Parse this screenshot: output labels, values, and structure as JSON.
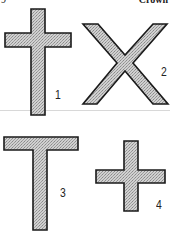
{
  "header": {
    "page_fragment": "9",
    "section_fragment": "Crown"
  },
  "figures": [
    {
      "id": 1,
      "shape": "latin-cross",
      "label": "1"
    },
    {
      "id": 2,
      "shape": "saltire-x-cross",
      "label": "2"
    },
    {
      "id": 3,
      "shape": "tau-cross",
      "label": "3"
    },
    {
      "id": 4,
      "shape": "greek-cross",
      "label": "4"
    }
  ],
  "style": {
    "fill": "#c4c4c4",
    "stroke": "#1a1a1a",
    "pattern": "stipple-halftone"
  }
}
